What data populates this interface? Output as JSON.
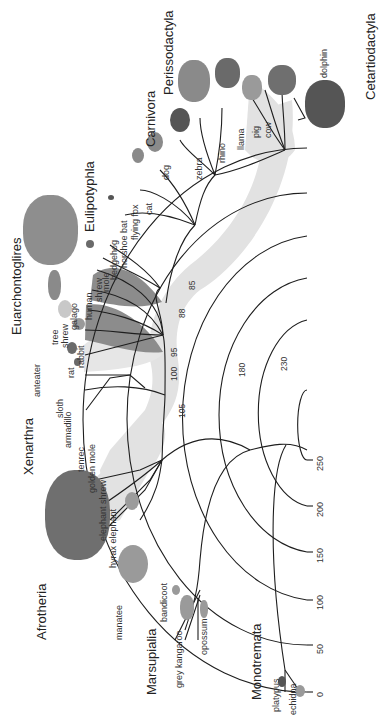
{
  "diagram": {
    "type": "phylogenetic-tree",
    "orientation": "rotated-90-ccw",
    "time_axis": {
      "unit": "million years ago",
      "ticks": [
        "0",
        "50",
        "100",
        "150",
        "200",
        "250"
      ]
    },
    "node_ages": [
      "85",
      "88",
      "95",
      "100",
      "105",
      "180",
      "230"
    ],
    "groups": [
      {
        "name": "Afrotheria",
        "species": [
          "manatee",
          "hyrax",
          "elephant",
          "elephant shrew",
          "golden mole",
          "tenrec"
        ]
      },
      {
        "name": "Xenarthra",
        "species": [
          "armadillo",
          "sloth",
          "anteater"
        ]
      },
      {
        "name": "Euarchontoglires",
        "species": [
          "rat",
          "rabbit",
          "tree shrew",
          "galago",
          "human"
        ]
      },
      {
        "name": "Eulipotyphla",
        "species": [
          "shrew",
          "mole",
          "hedgehog"
        ]
      },
      {
        "name": "Carnivora",
        "species": [
          "cat",
          "dog"
        ]
      },
      {
        "name": "Perissodactyla",
        "species": [
          "zebra",
          "rhino"
        ]
      },
      {
        "name": "Cetartiodactyla",
        "species": [
          "llama",
          "pig",
          "cow",
          "dolphin"
        ]
      },
      {
        "name": "Marsupialia",
        "species": [
          "bandicoot",
          "grey kangaroo",
          "opossum"
        ]
      },
      {
        "name": "Monotremata",
        "species": [
          "platypus",
          "echidna"
        ]
      }
    ],
    "extra_species": [
      "horshoe bat",
      "flying fox"
    ],
    "colors": {
      "line": "#1e1e1e",
      "light_band": "#e2e2e2",
      "dark_band": "#8c8c8c",
      "brain": "#8a8a8a"
    }
  },
  "labels": {
    "groups": {
      "afrotheria": "Afrotheria",
      "xenarthra": "Xenarthra",
      "euarchontoglires": "Euarchontoglires",
      "eulipotyphla": "Eulipotyphla",
      "carnivora": "Carnivora",
      "perissodactyla": "Perissodactyla",
      "cetartiodactyla": "Cetartiodactyla",
      "marsupialia": "Marsupialia",
      "monotremata": "Monotremata"
    },
    "species": {
      "manatee": "manatee",
      "hyrax_elephant": "hyrax  elephant",
      "elephant_shrew": "elephant shrew",
      "golden_mole": "golden mole",
      "tenrec": "tenrec",
      "armadillo": "armadillo",
      "sloth": "sloth",
      "anteater": "anteater",
      "rat": "rat",
      "rabbit": "rabbit",
      "tree": "tree",
      "shrew1": "shrew",
      "galago": "galago",
      "human": "human",
      "shrew2": "shrew",
      "mole": "mole",
      "hedgehog": "hedgehog",
      "horshoe_bat": "horshoe bat",
      "flying_fox": "flying fox",
      "cat": "cat",
      "dog": "dog",
      "zebra": "zebra",
      "rhino": "rhino",
      "llama": "llama",
      "pig": "pig",
      "cow": "cow",
      "dolphin": "dolphin",
      "bandicoot": "bandicoot",
      "grey_kangaroo": "grey kangaroo",
      "opossum": "opossum",
      "platypus": "platypus",
      "echidna": "echidna"
    },
    "ticks": {
      "t0": "0",
      "t50": "50",
      "t100": "100",
      "t150": "150",
      "t200": "200",
      "t250": "250"
    },
    "nodes": {
      "n85": "85",
      "n88": "88",
      "n95": "95",
      "n100": "100",
      "n105": "105",
      "n180": "180",
      "n230": "230"
    }
  }
}
